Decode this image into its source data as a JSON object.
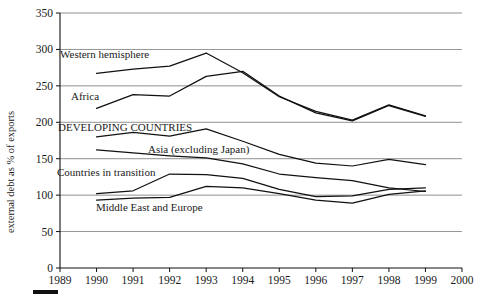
{
  "chart_data": {
    "type": "line",
    "title": "",
    "xlabel": "",
    "ylabel": "external debt as % of exports",
    "x": [
      1990,
      1991,
      1992,
      1993,
      1994,
      1995,
      1996,
      1997,
      1998,
      1999
    ],
    "xlim": [
      1989,
      2000
    ],
    "ylim": [
      0,
      350
    ],
    "ytick_labels": [
      "0",
      "50",
      "100",
      "150",
      "200",
      "250",
      "300",
      "350"
    ],
    "yticks": [
      0,
      50,
      100,
      150,
      200,
      250,
      300,
      350
    ],
    "xtick_labels": [
      "1989",
      "1990",
      "1991",
      "1992",
      "1993",
      "1994",
      "1995",
      "1996",
      "1997",
      "1998",
      "1999",
      "2000"
    ],
    "xticks": [
      1989,
      1990,
      1991,
      1992,
      1993,
      1994,
      1995,
      1996,
      1997,
      1998,
      1999,
      2000
    ],
    "grid": true,
    "grid_axis": "y",
    "legend": "inline-annotations",
    "series": [
      {
        "name": "Western hemisphere",
        "label": "Western hemisphere",
        "values": [
          267,
          273,
          277,
          295,
          268,
          235,
          215,
          203,
          224,
          209
        ]
      },
      {
        "name": "Africa",
        "label": "Africa",
        "values": [
          219,
          238,
          236,
          263,
          270,
          236,
          213,
          202,
          223,
          208
        ]
      },
      {
        "name": "DEVELOPING COUNTRIES",
        "label": "DEVELOPING COUNTRIES",
        "values": [
          180,
          186,
          181,
          191,
          174,
          156,
          144,
          140,
          149,
          142
        ]
      },
      {
        "name": "Asia (excluding Japan)",
        "label": "Asia (excluding Japan)",
        "values": [
          162,
          158,
          154,
          151,
          143,
          129,
          124,
          120,
          110,
          105
        ]
      },
      {
        "name": "Countries in transition",
        "label": "Countries in transition",
        "values": [
          102,
          106,
          129,
          128,
          123,
          108,
          98,
          99,
          108,
          110
        ]
      },
      {
        "name": "Middle East and Europe",
        "label": "Middle East and Europe",
        "values": [
          93,
          96,
          97,
          112,
          110,
          102,
          93,
          89,
          101,
          106
        ]
      }
    ],
    "annotations": [
      {
        "text": "Western hemisphere",
        "x_px": 60,
        "y_px": 58
      },
      {
        "text": "Africa",
        "x_px": 71,
        "y_px": 100
      },
      {
        "text": "DEVELOPING COUNTRIES",
        "x_px": 58,
        "y_px": 131
      },
      {
        "text": "Asia (excluding Japan)",
        "x_px": 148,
        "y_px": 153
      },
      {
        "text": "Countries in transition",
        "x_px": 57,
        "y_px": 176
      },
      {
        "text": "Middle East and Europe",
        "x_px": 96,
        "y_px": 211
      }
    ]
  },
  "footer": {
    "corner_mark": "black-bar"
  }
}
